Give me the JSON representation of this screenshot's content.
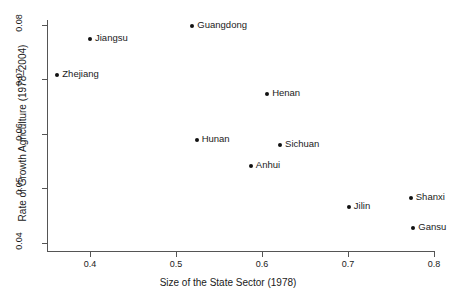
{
  "chart_data": {
    "type": "scatter",
    "title": "",
    "xlabel": "Size of the State Sector (1978)",
    "ylabel": "Rate of Growth Agriculture (1978–2004)",
    "xlim": [
      0.35,
      0.81
    ],
    "ylim": [
      0.0385,
      0.0805
    ],
    "xticks": [
      "0.4",
      "0.5",
      "0.6",
      "0.7",
      "0.8"
    ],
    "xtick_values": [
      0.4,
      0.5,
      0.6,
      0.7,
      0.8
    ],
    "yticks": [
      "0.04",
      "0.05",
      "0.06",
      "0.07",
      "0.08"
    ],
    "ytick_values": [
      0.04,
      0.05,
      0.06,
      0.07,
      0.08
    ],
    "grid": false,
    "legend": "none",
    "point_color": "#111111",
    "axis_color": "#555555",
    "points": [
      {
        "label": "Zhejiang",
        "x": 0.362,
        "y": 0.0708,
        "label_side": "right"
      },
      {
        "label": "Jiangsu",
        "x": 0.4,
        "y": 0.0774,
        "label_side": "right"
      },
      {
        "label": "Guangdong",
        "x": 0.519,
        "y": 0.0798,
        "label_side": "right"
      },
      {
        "label": "Henan",
        "x": 0.606,
        "y": 0.0674,
        "label_side": "right"
      },
      {
        "label": "Hunan",
        "x": 0.524,
        "y": 0.0589,
        "label_side": "right"
      },
      {
        "label": "Sichuan",
        "x": 0.621,
        "y": 0.0579,
        "label_side": "right"
      },
      {
        "label": "Anhui",
        "x": 0.587,
        "y": 0.0542,
        "label_side": "right"
      },
      {
        "label": "Jilin",
        "x": 0.701,
        "y": 0.0466,
        "label_side": "right"
      },
      {
        "label": "Shanxi",
        "x": 0.773,
        "y": 0.0483,
        "label_side": "right"
      },
      {
        "label": "Gansu",
        "x": 0.776,
        "y": 0.0428,
        "label_side": "right"
      }
    ]
  }
}
